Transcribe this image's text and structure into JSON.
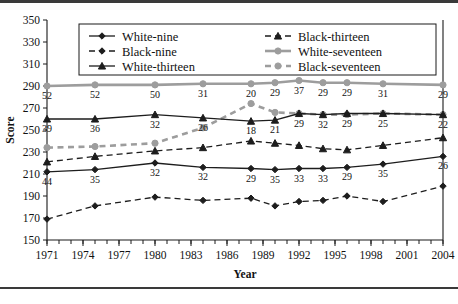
{
  "chart_data": {
    "type": "line",
    "title": "",
    "xlabel": "Year",
    "ylabel": "Score",
    "ylim": [
      150,
      350
    ],
    "yticks": [
      150,
      170,
      190,
      210,
      230,
      250,
      270,
      290,
      310,
      330,
      350
    ],
    "xlim": [
      1971,
      2004
    ],
    "xticks": [
      1971,
      1974,
      1977,
      1980,
      1983,
      1986,
      1989,
      1992,
      1995,
      1998,
      2001,
      2004
    ],
    "xticklabels": [
      "1971",
      "1974",
      "1977",
      "1980",
      "1983",
      "1986",
      "1989",
      "1992",
      "1995",
      "1998",
      "2001",
      "2004"
    ],
    "minor_xticks": [
      1971,
      1972,
      1973,
      1974,
      1975,
      1976,
      1977,
      1978,
      1979,
      1980,
      1981,
      1982,
      1983,
      1984,
      1985,
      1986,
      1987,
      1988,
      1989,
      1990,
      1991,
      1992,
      1993,
      1994,
      1995,
      1996,
      1997,
      1998,
      1999,
      2000,
      2001,
      2002,
      2003,
      2004
    ],
    "grid": false,
    "legend_position": "upper-center",
    "x": [
      1971,
      1975,
      1980,
      1984,
      1988,
      1990,
      1992,
      1994,
      1996,
      1999,
      2004
    ],
    "series": [
      {
        "name": "White-nine",
        "style": "solid",
        "color": "#1d1d1d",
        "marker": "diamond",
        "values": [
          212,
          214,
          220,
          216,
          215,
          214,
          215,
          215,
          216,
          219,
          226
        ],
        "point_labels": [
          "44",
          "35",
          "32",
          "32",
          "29",
          "35",
          "33",
          "33",
          "29",
          "35",
          "26"
        ]
      },
      {
        "name": "Black-nine",
        "style": "dashed",
        "color": "#1d1d1d",
        "marker": "diamond",
        "values": [
          169,
          181,
          189,
          186,
          188,
          181,
          185,
          186,
          190,
          185,
          199
        ],
        "point_labels": []
      },
      {
        "name": "White-thirteen",
        "style": "solid",
        "color": "#1d1d1d",
        "marker": "triangle",
        "values": [
          260,
          260,
          264,
          261,
          258,
          259,
          265,
          264,
          265,
          265,
          264
        ],
        "point_labels": [
          "39",
          "36",
          "32",
          "26",
          "18",
          "21",
          "29",
          "32",
          "29",
          "25",
          "22"
        ]
      },
      {
        "name": "Black-thirteen",
        "style": "dashed",
        "color": "#1d1d1d",
        "marker": "triangle",
        "values": [
          221,
          226,
          231,
          234,
          240,
          238,
          236,
          233,
          232,
          236,
          243
        ],
        "point_labels": []
      },
      {
        "name": "White-seventeen",
        "style": "solid",
        "color": "#9d9d9d",
        "marker": "circle",
        "values": [
          290,
          291,
          291,
          292,
          292,
          293,
          295,
          293,
          293,
          292,
          291
        ],
        "point_labels": [
          "52",
          "52",
          "50",
          "31",
          "20",
          "29",
          "37",
          "29",
          "29",
          "31",
          "29"
        ]
      },
      {
        "name": "Black-seventeen",
        "style": "dashed",
        "color": "#9d9d9d",
        "marker": "circle",
        "values": [
          234,
          235,
          238,
          252,
          274,
          266,
          265,
          264,
          264,
          265,
          264
        ],
        "point_labels": []
      }
    ],
    "legend": [
      "White-nine",
      "Black-nine",
      "White-thirteen",
      "Black-thirteen",
      "White-seventeen",
      "Black-seventeen"
    ]
  }
}
